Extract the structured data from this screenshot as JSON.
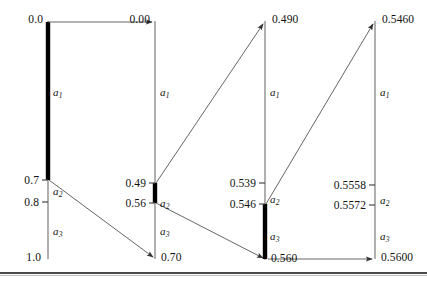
{
  "figure": {
    "axis_color": "#6e6e6e",
    "highlight_color": "#000000",
    "arrow_color": "#555555",
    "columns": [
      {
        "id": "stage-1",
        "x": 48,
        "top_value": "0.0",
        "bottom_value": "1.0",
        "ticks": [
          {
            "value": "0.0",
            "y": 22
          },
          {
            "value": "0.7",
            "y": 180
          },
          {
            "value": "0.8",
            "y": 202
          },
          {
            "value": "1.0",
            "y": 258
          }
        ],
        "segments": [
          {
            "label": "a",
            "sub": "1",
            "y": 92
          },
          {
            "label": "a",
            "sub": "2",
            "y": 191
          },
          {
            "label": "a",
            "sub": "3",
            "y": 231
          }
        ],
        "highlight": {
          "from_y": 22,
          "to_y": 180
        }
      },
      {
        "id": "stage-2",
        "x": 155,
        "top_value": "0.00",
        "bottom_value": "0.70",
        "ticks": [
          {
            "value": "0.00",
            "y": 22
          },
          {
            "value": "0.49",
            "y": 183
          },
          {
            "value": "0.56",
            "y": 203
          },
          {
            "value": "0.70",
            "y": 258
          }
        ],
        "segments": [
          {
            "label": "a",
            "sub": "1",
            "y": 92
          },
          {
            "label": "a",
            "sub": "2",
            "y": 203
          },
          {
            "label": "a",
            "sub": "3",
            "y": 231
          }
        ],
        "highlight": {
          "from_y": 183,
          "to_y": 203
        }
      },
      {
        "id": "stage-3",
        "x": 265,
        "top_value": "0.490",
        "bottom_value": "0.560",
        "ticks": [
          {
            "value": "0.490",
            "y": 22
          },
          {
            "value": "0.539",
            "y": 183
          },
          {
            "value": "0.546",
            "y": 204
          },
          {
            "value": "0.560",
            "y": 259
          }
        ],
        "segments": [
          {
            "label": "a",
            "sub": "1",
            "y": 92
          },
          {
            "label": "a",
            "sub": "2",
            "y": 199
          },
          {
            "label": "a",
            "sub": "3",
            "y": 236
          }
        ],
        "highlight": {
          "from_y": 204,
          "to_y": 259
        }
      },
      {
        "id": "stage-4",
        "x": 375,
        "top_value": "0.5460",
        "bottom_value": "0.5600",
        "ticks": [
          {
            "value": "0.5460",
            "y": 22
          },
          {
            "value": "0.5558",
            "y": 185
          },
          {
            "value": "0.5572",
            "y": 205
          },
          {
            "value": "0.5600",
            "y": 258
          }
        ],
        "segments": [
          {
            "label": "a",
            "sub": "1",
            "y": 92
          },
          {
            "label": "a",
            "sub": "2",
            "y": 200
          },
          {
            "label": "a",
            "sub": "3",
            "y": 236
          }
        ],
        "highlight": null
      }
    ],
    "connectors": [
      {
        "name": "stage1-top-to-stage2-top",
        "x1": 48,
        "y1": 22,
        "x2": 152,
        "y2": 22
      },
      {
        "name": "stage1-0.7-to-stage2-bottom",
        "x1": 49,
        "y1": 180,
        "x2": 153,
        "y2": 257
      },
      {
        "name": "stage2-0.49-to-stage3-top",
        "x1": 156,
        "y1": 183,
        "x2": 263,
        "y2": 24
      },
      {
        "name": "stage2-0.56-to-stage3-bottom",
        "x1": 156,
        "y1": 203,
        "x2": 263,
        "y2": 258
      },
      {
        "name": "stage3-0.546-to-stage4-top",
        "x1": 266,
        "y1": 204,
        "x2": 373,
        "y2": 24
      },
      {
        "name": "stage3-bottom-to-stage4-bottom",
        "x1": 268,
        "y1": 259,
        "x2": 372,
        "y2": 259
      }
    ]
  }
}
